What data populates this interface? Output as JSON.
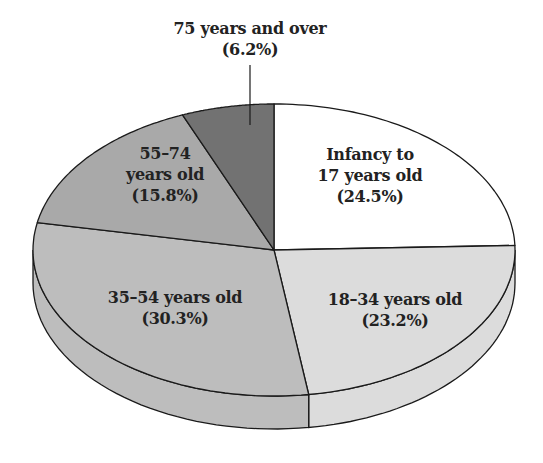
{
  "chart_data": {
    "type": "pie",
    "style": "3d",
    "title": "",
    "start_angle_deg": 0,
    "direction": "clockwise",
    "geometry": {
      "cx": 274,
      "cy": 250,
      "rx": 241,
      "ry": 146,
      "depth": 33
    },
    "slices": [
      {
        "label": "Infancy to 17 years old",
        "value": 24.5,
        "value_label": "(24.5%)",
        "color": "#ffffff"
      },
      {
        "label": "18–34 years old",
        "value": 23.2,
        "value_label": "(23.2%)",
        "color": "#dcdcdc"
      },
      {
        "label": "35–54 years old",
        "value": 30.3,
        "value_label": "(30.3%)",
        "color": "#bdbdbd"
      },
      {
        "label": "55–74 years old",
        "value": 15.8,
        "value_label": "(15.8%)",
        "color": "#a9a9a9"
      },
      {
        "label": "75 years and over",
        "value": 6.2,
        "value_label": "(6.2%)",
        "color": "#727272"
      }
    ],
    "stroke_color": "#1a1a1a"
  },
  "labels": {
    "infancy": {
      "line1": "Infancy to",
      "line2": "17 years old",
      "line3": "(24.5%)"
    },
    "age18_34": {
      "line1": "18–34 years old",
      "line2": "(23.2%)"
    },
    "age35_54": {
      "line1": "35–54 years old",
      "line2": "(30.3%)"
    },
    "age55_74": {
      "line1": "55–74",
      "line2": "years old",
      "line3": "(15.8%)"
    },
    "age75_over": {
      "line1": "75 years and over",
      "line2": "(6.2%)"
    }
  }
}
